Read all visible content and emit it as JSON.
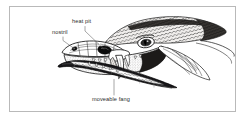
{
  "figure": {
    "kind": "scientific-illustration",
    "style": "black-and-white stipple / engraving line drawing",
    "frame_color": "#b9b9b9",
    "background_color": "#ffffff",
    "ink_color": "#1a1a1a",
    "leader_color": "#5a5a5a"
  },
  "labels": [
    {
      "id": "heat-pit",
      "text": "heat pit",
      "leader": "line from label down-right to the facial pit organ between eye and nostril"
    },
    {
      "id": "nostril",
      "text": "nostril",
      "leader": "line from label down-right to the nostril opening on the snout"
    },
    {
      "id": "moveable-fang",
      "text": "moveable fang",
      "leader": "line from label straight up to the hinged maxillary fang in the open mouth"
    }
  ]
}
